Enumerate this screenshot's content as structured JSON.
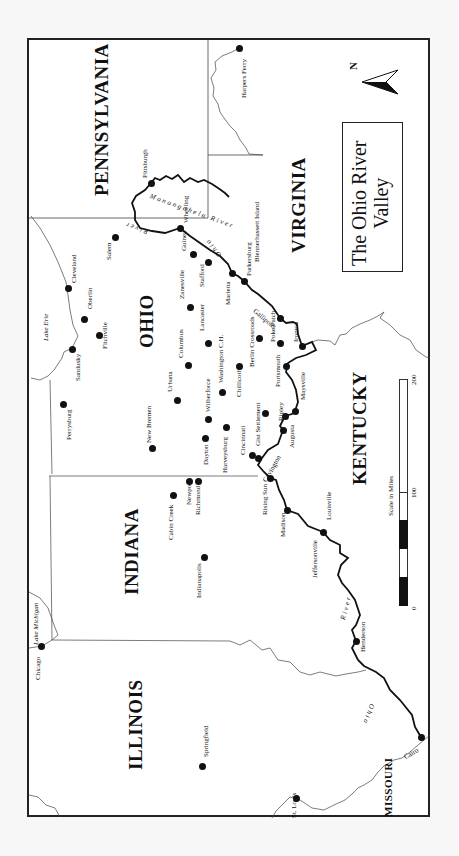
{
  "title": {
    "line1": "The Ohio River",
    "line2": "Valley"
  },
  "compass": {
    "label": "N",
    "direction": "right"
  },
  "states": [
    {
      "name": "PENNSYLVANIA",
      "x": 92,
      "y": 196
    },
    {
      "name": "VIRGINIA",
      "x": 289,
      "y": 253
    },
    {
      "name": "OHIO",
      "x": 137,
      "y": 348
    },
    {
      "name": "INDIANA",
      "x": 122,
      "y": 595
    },
    {
      "name": "KENTUCKY",
      "x": 350,
      "y": 485
    },
    {
      "name": "ILLINOIS",
      "x": 126,
      "y": 770
    },
    {
      "name": "MISSOURI",
      "x": 383,
      "y": 817
    }
  ],
  "water_labels": [
    {
      "name": "Lake Erie",
      "x": 43,
      "y": 341
    },
    {
      "name": "Lake Michigan",
      "x": 33,
      "y": 645
    }
  ],
  "river_labels": [
    {
      "name": "Monongahela River",
      "x": 151,
      "y": 193
    },
    {
      "name": "River",
      "x": 147,
      "y": 235
    },
    {
      "name": "Ohio",
      "x": 218,
      "y": 258
    },
    {
      "name": "River",
      "x": 340,
      "y": 619
    },
    {
      "name": "Ohio",
      "x": 375,
      "y": 705
    }
  ],
  "cities": [
    {
      "name": "Pittsburgh",
      "dot": [
        151,
        183
      ],
      "label": [
        142,
        178
      ]
    },
    {
      "name": "Wheeling",
      "dot": [
        180,
        228
      ],
      "label": [
        183,
        223
      ]
    },
    {
      "name": "Harpers Ferry",
      "dot": [
        239,
        48
      ],
      "label": [
        241,
        98
      ]
    },
    {
      "name": "Salem",
      "dot": [
        115,
        237
      ],
      "label": [
        106,
        260
      ]
    },
    {
      "name": "Cleveland",
      "dot": [
        68,
        288
      ],
      "label": [
        71,
        283
      ]
    },
    {
      "name": "Oberlin",
      "dot": [
        84,
        319
      ],
      "label": [
        87,
        309
      ]
    },
    {
      "name": "Fitchville",
      "dot": [
        99,
        335
      ],
      "label": [
        102,
        349
      ]
    },
    {
      "name": "Sandusky",
      "dot": [
        72,
        349
      ],
      "label": [
        75,
        381
      ]
    },
    {
      "name": "Perrysburg",
      "dot": [
        63,
        404
      ],
      "label": [
        66,
        440
      ]
    },
    {
      "name": "Guinea",
      "dot": [
        193,
        254
      ],
      "label": [
        181,
        251
      ]
    },
    {
      "name": "Zanesville",
      "dot": [
        190,
        307
      ],
      "label": [
        179,
        299
      ]
    },
    {
      "name": "Stafford",
      "dot": [
        208,
        262
      ],
      "label": [
        199,
        287
      ]
    },
    {
      "name": "Marietta",
      "dot": [
        232,
        273
      ],
      "label": [
        225,
        305
      ]
    },
    {
      "name": "Parkersburg",
      "dot": [
        244,
        281
      ],
      "label": [
        246,
        276
      ]
    },
    {
      "name": "Blennerhassett Island",
      "dot": [
        246,
        282
      ],
      "label": [
        254,
        262
      ]
    },
    {
      "name": "Columbus",
      "dot": [
        188,
        365
      ],
      "label": [
        178,
        358
      ]
    },
    {
      "name": "Lancaster",
      "dot": [
        208,
        343
      ],
      "label": [
        199,
        331
      ]
    },
    {
      "name": "Washington C.H.",
      "dot": [
        222,
        392
      ],
      "label": [
        218,
        383
      ]
    },
    {
      "name": "Berlin Crossroads",
      "dot": [
        259,
        338
      ],
      "label": [
        249,
        367
      ]
    },
    {
      "name": "Poke Patch",
      "dot": [
        280,
        343
      ],
      "label": [
        270,
        342
      ]
    },
    {
      "name": "Gallipolis",
      "dot": [
        280,
        318
      ],
      "label": [
        256,
        318
      ]
    },
    {
      "name": "Ironton",
      "dot": [
        302,
        346
      ],
      "label": [
        293,
        342
      ]
    },
    {
      "name": "Portsmouth",
      "dot": [
        286,
        366
      ],
      "label": [
        275,
        387
      ]
    },
    {
      "name": "Chillicothe",
      "dot": [
        239,
        366
      ],
      "label": [
        236,
        397
      ]
    },
    {
      "name": "Urbana",
      "dot": [
        177,
        400
      ],
      "label": [
        167,
        392
      ]
    },
    {
      "name": "New Bremen",
      "dot": [
        152,
        448
      ],
      "label": [
        146,
        443
      ]
    },
    {
      "name": "Wilberforce",
      "dot": [
        208,
        419
      ],
      "label": [
        205,
        412
      ]
    },
    {
      "name": "Dayton",
      "dot": [
        205,
        438
      ],
      "label": [
        203,
        465
      ]
    },
    {
      "name": "Harveysburg",
      "dot": [
        226,
        427
      ],
      "label": [
        222,
        473
      ]
    },
    {
      "name": "Gist Settlement",
      "dot": [
        265,
        413
      ],
      "label": [
        255,
        446
      ]
    },
    {
      "name": "Ripley",
      "dot": [
        285,
        416
      ],
      "label": [
        278,
        421
      ]
    },
    {
      "name": "Maysville",
      "dot": [
        295,
        411
      ],
      "label": [
        300,
        400
      ]
    },
    {
      "name": "Augusta",
      "dot": [
        283,
        430
      ],
      "label": [
        289,
        448
      ]
    },
    {
      "name": "Cincinnati",
      "dot": [
        252,
        455
      ],
      "label": [
        240,
        455
      ]
    },
    {
      "name": "Covington",
      "dot": [
        258,
        458
      ],
      "label": [
        262,
        480
      ]
    },
    {
      "name": "Newport",
      "dot": [
        189,
        481
      ],
      "label": [
        186,
        505
      ]
    },
    {
      "name": "Richmond",
      "dot": [
        198,
        481
      ],
      "label": [
        195,
        515
      ]
    },
    {
      "name": "Cabin Creek",
      "dot": [
        173,
        495
      ],
      "label": [
        168,
        540
      ]
    },
    {
      "name": "Rising Sun",
      "dot": [
        270,
        478
      ],
      "label": [
        262,
        515
      ]
    },
    {
      "name": "Madison",
      "dot": [
        287,
        510
      ],
      "label": [
        280,
        537
      ]
    },
    {
      "name": "Louisville",
      "dot": [
        323,
        532
      ],
      "label": [
        326,
        520
      ]
    },
    {
      "name": "Jeffersonville",
      "dot": [
        322,
        534
      ],
      "label": [
        312,
        578
      ]
    },
    {
      "name": "Indianapolis",
      "dot": [
        204,
        557
      ],
      "label": [
        196,
        598
      ]
    },
    {
      "name": "Henderson",
      "dot": [
        356,
        641
      ],
      "label": [
        360,
        652
      ]
    },
    {
      "name": "Chicago",
      "dot": [
        41,
        646
      ],
      "label": [
        35,
        680
      ]
    },
    {
      "name": "Springfield",
      "dot": [
        202,
        766
      ],
      "label": [
        203,
        757
      ]
    },
    {
      "name": "Cairo",
      "dot": [
        421,
        737
      ],
      "label": [
        403,
        755
      ]
    },
    {
      "name": "St. Louis",
      "dot": [
        296,
        798
      ],
      "label": [
        291,
        818
      ]
    }
  ],
  "scale": {
    "title": "Scale in Miles",
    "unit": "miles",
    "ticks": [
      "0",
      "100",
      "200"
    ]
  }
}
